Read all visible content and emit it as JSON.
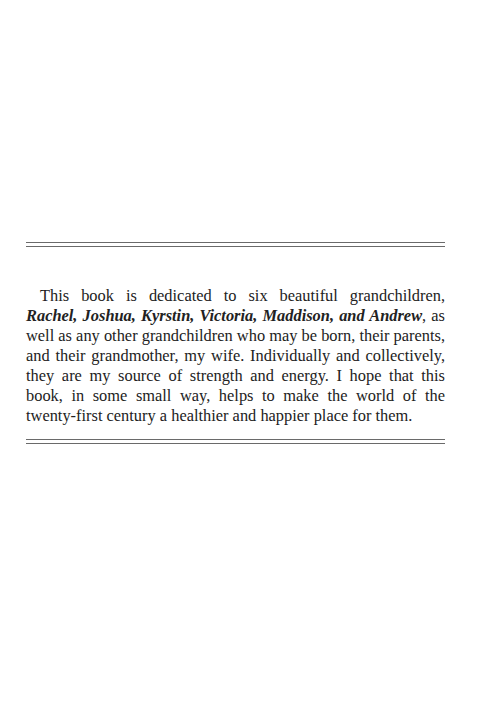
{
  "dedication": {
    "intro": "This book is dedicated to six beautiful grandchildren, ",
    "names": "Rachel, Joshua, Kyrstin, Victoria, Maddison, and Andrew",
    "body": ", as well as any other grandchildren who may be born, their parents, and their grandmother, my wife. Individually and collectively, they are my source of strength and energy. I hope that this book, in some small way, helps to make the world of the twenty-first century a healthier and happier place for them."
  }
}
